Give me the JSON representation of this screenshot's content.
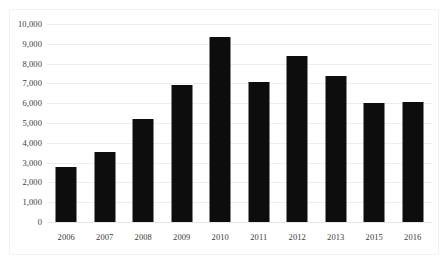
{
  "chart_data": {
    "type": "bar",
    "title": "",
    "subtitle": "",
    "xlabel": "",
    "ylabel": "",
    "categories": [
      "2006",
      "2007",
      "2008",
      "2009",
      "2010",
      "2011",
      "2012",
      "2013",
      "2015",
      "2016"
    ],
    "values": [
      2800,
      3530,
      5180,
      6900,
      9350,
      7050,
      8400,
      7350,
      6000,
      6050
    ],
    "ylim": [
      0,
      10000
    ],
    "ytick_step": 1000,
    "ytick_labels": [
      "10,000",
      "9,000",
      "8,000",
      "7,000",
      "6,000",
      "5,000",
      "4,000",
      "3,000",
      "2,000",
      "1,000",
      "0"
    ],
    "ytick_values": [
      10000,
      9000,
      8000,
      7000,
      6000,
      5000,
      4000,
      3000,
      2000,
      1000,
      0
    ],
    "grid": true,
    "grid_axis": "y",
    "legend": false,
    "legend_position": "none",
    "bar_color": "#0d0d0d",
    "grid_color": "#ededed",
    "frame_color": "#f2f2f2",
    "tick_label_color": "#3a3a3a",
    "background_color": "#ffffff",
    "annotations": []
  }
}
